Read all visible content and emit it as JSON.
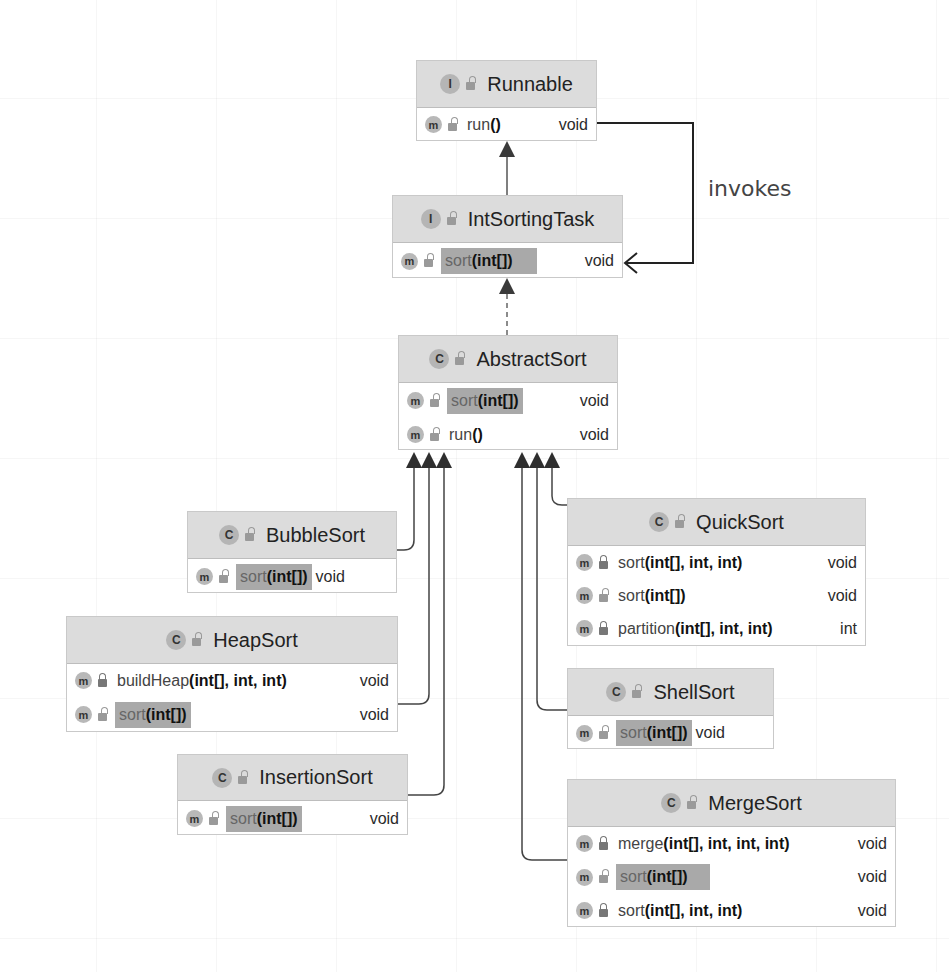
{
  "diagram": {
    "type": "UML class diagram",
    "edge_label": "invokes",
    "nodes": {
      "runnable": {
        "kind_badge": "I",
        "name": "Runnable",
        "methods": [
          {
            "badge": "m",
            "visibility": "public",
            "name": "run",
            "params": "()",
            "return": "void",
            "highlighted": false
          }
        ]
      },
      "int_sorting_task": {
        "kind_badge": "I",
        "name": "IntSortingTask",
        "methods": [
          {
            "badge": "m",
            "visibility": "public",
            "name": "sort",
            "params": "(int[])",
            "return": "void",
            "highlighted": true
          }
        ]
      },
      "abstract_sort": {
        "kind_badge": "C",
        "name": "AbstractSort",
        "methods": [
          {
            "badge": "m",
            "visibility": "public",
            "name": "sort",
            "params": "(int[])",
            "return": "void",
            "highlighted": true
          },
          {
            "badge": "m",
            "visibility": "public",
            "name": "run",
            "params": "()",
            "return": "void",
            "highlighted": false
          }
        ]
      },
      "bubble_sort": {
        "kind_badge": "C",
        "name": "BubbleSort",
        "methods": [
          {
            "badge": "m",
            "visibility": "public",
            "name": "sort",
            "params": "(int[])",
            "return": "void",
            "highlighted": true
          }
        ]
      },
      "heap_sort": {
        "kind_badge": "C",
        "name": "HeapSort",
        "methods": [
          {
            "badge": "m",
            "visibility": "private",
            "name": "buildHeap",
            "params": "(int[], int, int)",
            "return": "void",
            "highlighted": false
          },
          {
            "badge": "m",
            "visibility": "public",
            "name": "sort",
            "params": "(int[])",
            "return": "void",
            "highlighted": true
          }
        ]
      },
      "insertion_sort": {
        "kind_badge": "C",
        "name": "InsertionSort",
        "methods": [
          {
            "badge": "m",
            "visibility": "public",
            "name": "sort",
            "params": "(int[])",
            "return": "void",
            "highlighted": true
          }
        ]
      },
      "quick_sort": {
        "kind_badge": "C",
        "name": "QuickSort",
        "methods": [
          {
            "badge": "m",
            "visibility": "private",
            "name": "sort",
            "params": "(int[], int, int)",
            "return": "void",
            "highlighted": false
          },
          {
            "badge": "m",
            "visibility": "public",
            "name": "sort",
            "params": "(int[])",
            "return": "void",
            "highlighted": false
          },
          {
            "badge": "m",
            "visibility": "private",
            "name": "partition",
            "params": "(int[], int, int)",
            "return": "int",
            "highlighted": false
          }
        ]
      },
      "shell_sort": {
        "kind_badge": "C",
        "name": "ShellSort",
        "methods": [
          {
            "badge": "m",
            "visibility": "public",
            "name": "sort",
            "params": "(int[])",
            "return": "void",
            "highlighted": true
          }
        ]
      },
      "merge_sort": {
        "kind_badge": "C",
        "name": "MergeSort",
        "methods": [
          {
            "badge": "m",
            "visibility": "private",
            "name": "merge",
            "params": "(int[], int, int, int)",
            "return": "void",
            "highlighted": false
          },
          {
            "badge": "m",
            "visibility": "public",
            "name": "sort",
            "params": "(int[])",
            "return": "void",
            "highlighted": true
          },
          {
            "badge": "m",
            "visibility": "private",
            "name": "sort",
            "params": "(int[], int, int)",
            "return": "void",
            "highlighted": false
          }
        ]
      }
    },
    "edges": [
      {
        "from": "IntSortingTask",
        "to": "Runnable",
        "type": "extends",
        "style": "solid"
      },
      {
        "from": "AbstractSort",
        "to": "IntSortingTask",
        "type": "implements",
        "style": "dashed"
      },
      {
        "from": "BubbleSort",
        "to": "AbstractSort",
        "type": "extends",
        "style": "solid"
      },
      {
        "from": "HeapSort",
        "to": "AbstractSort",
        "type": "extends",
        "style": "solid"
      },
      {
        "from": "InsertionSort",
        "to": "AbstractSort",
        "type": "extends",
        "style": "solid"
      },
      {
        "from": "QuickSort",
        "to": "AbstractSort",
        "type": "extends",
        "style": "solid"
      },
      {
        "from": "ShellSort",
        "to": "AbstractSort",
        "type": "extends",
        "style": "solid"
      },
      {
        "from": "MergeSort",
        "to": "AbstractSort",
        "type": "extends",
        "style": "solid"
      },
      {
        "from": "Runnable.run()",
        "to": "IntSortingTask.sort(int[])",
        "type": "invokes",
        "style": "solid-open-arrow"
      }
    ],
    "colors": {
      "header_bg": "#dcdcdc",
      "highlight_bg": "#a9a9a9",
      "border": "#c9c9c9",
      "edge": "#3a3a3a",
      "badge": "#b5b5b5"
    }
  }
}
